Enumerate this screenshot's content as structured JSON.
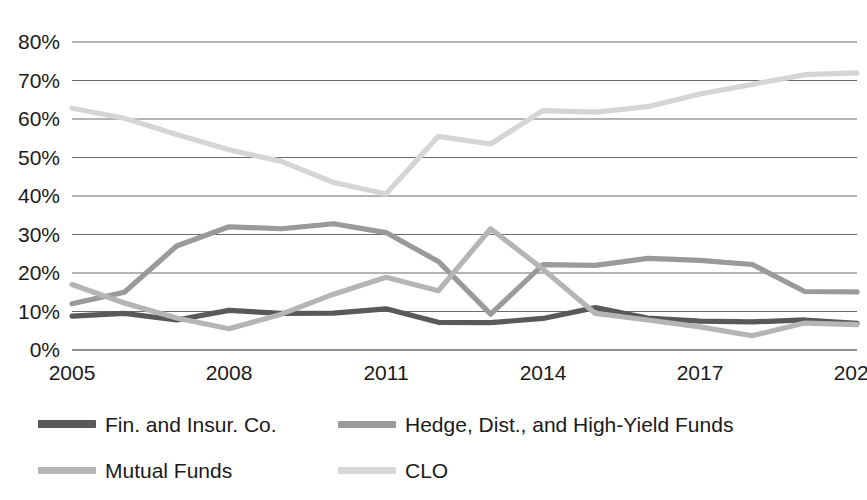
{
  "chart_data": {
    "type": "line",
    "title": "",
    "subtitle": "",
    "xlabel": "",
    "ylabel": "",
    "x": [
      2005,
      2006,
      2007,
      2008,
      2009,
      2010,
      2011,
      2012,
      2013,
      2014,
      2015,
      2016,
      2017,
      2018,
      2019,
      2020
    ],
    "xlim": [
      2005,
      2020
    ],
    "ylim": [
      0,
      80
    ],
    "grid": true,
    "legend_position": "bottom",
    "y_tick_labels": [
      "0%",
      "10%",
      "20%",
      "30%",
      "40%",
      "50%",
      "60%",
      "70%",
      "80%"
    ],
    "y_tick_values": [
      0,
      10,
      20,
      30,
      40,
      50,
      60,
      70,
      80
    ],
    "x_tick_labels": [
      "2005",
      "2008",
      "2011",
      "2014",
      "2017",
      "2020"
    ],
    "x_tick_values": [
      2005,
      2008,
      2011,
      2014,
      2017,
      2020
    ],
    "series": [
      {
        "name": "Fin. and Insur. Co.",
        "color": "#595959",
        "values": [
          8.8,
          9.5,
          7.8,
          10.3,
          9.5,
          9.6,
          10.7,
          7.2,
          7.1,
          8.2,
          11.0,
          8.3,
          7.5,
          7.3,
          7.8,
          6.9
        ]
      },
      {
        "name": "Hedge, Dist., and High-Yield Funds",
        "color": "#9a9a9a",
        "values": [
          12.0,
          15.0,
          27.0,
          32.0,
          31.5,
          32.8,
          30.5,
          23.0,
          9.3,
          22.2,
          22.0,
          23.8,
          23.3,
          22.2,
          15.2,
          15.1
        ]
      },
      {
        "name": "Mutual Funds",
        "color": "#b5b5b5",
        "values": [
          17.0,
          12.2,
          8.3,
          5.5,
          9.3,
          14.5,
          18.9,
          15.4,
          31.5,
          21.0,
          9.5,
          7.8,
          6.0,
          3.7,
          7.0,
          6.6
        ]
      },
      {
        "name": "CLO",
        "color": "#d5d5d5",
        "values": [
          62.8,
          60.2,
          56.0,
          52.0,
          49.0,
          43.5,
          40.5,
          55.5,
          53.5,
          62.2,
          61.8,
          63.2,
          66.5,
          69.0,
          71.5,
          72.0
        ]
      }
    ]
  },
  "legend": {
    "items": [
      {
        "label": "Fin. and Insur. Co."
      },
      {
        "label": "Hedge, Dist., and High-Yield Funds"
      },
      {
        "label": "Mutual Funds"
      },
      {
        "label": "CLO"
      }
    ]
  },
  "colors": {
    "background": "#ffffff",
    "gridline": "#6b6b6b",
    "text": "#1a1a1a"
  }
}
